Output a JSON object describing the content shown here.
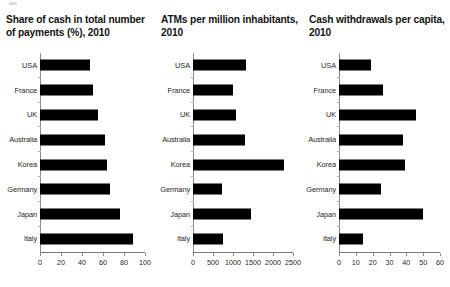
{
  "figure": {
    "background": "#ffffff",
    "bar_color": "#000000",
    "axis_color": "#8c8c8c",
    "text_color": "#1a1a1a"
  },
  "categories": [
    "USA",
    "France",
    "UK",
    "Australia",
    "Korea",
    "Germany",
    "Japan",
    "Italy"
  ],
  "panels": [
    {
      "id": "share-of-cash",
      "title": "Share of cash in total number of payments (%), 2010",
      "ticks": [
        "0",
        "20",
        "40",
        "60",
        "80",
        "100"
      ],
      "tick_values": [
        0,
        20,
        40,
        60,
        80,
        100
      ],
      "xmin": 0,
      "xmax": 100,
      "values": [
        48,
        50,
        55,
        62,
        64,
        67,
        76,
        89
      ],
      "label_width": 40
    },
    {
      "id": "atms-per-million",
      "title": "ATMs per million inhabitants, 2010",
      "ticks": [
        "0",
        "500",
        "1000",
        "1500",
        "2000",
        "2500"
      ],
      "tick_values": [
        0,
        500,
        1000,
        1500,
        2000,
        2500
      ],
      "xmin": 0,
      "xmax": 2500,
      "values": [
        1330,
        1010,
        1080,
        1300,
        2270,
        720,
        1450,
        760
      ],
      "label_width": 38
    },
    {
      "id": "cash-withdrawals-per-capita",
      "title": "Cash withdrawals per capita, 2010",
      "ticks": [
        "0",
        "10",
        "20",
        "30",
        "40",
        "50",
        "60"
      ],
      "tick_values": [
        0,
        10,
        20,
        30,
        40,
        50,
        60
      ],
      "xmin": 0,
      "xmax": 60,
      "values": [
        19,
        26,
        46,
        38,
        39,
        25,
        50,
        14
      ],
      "label_width": 36
    }
  ],
  "chart_data": [
    {
      "type": "bar",
      "orientation": "horizontal",
      "title": "Share of cash in total number of payments (%), 2010",
      "xlabel": "",
      "ylabel": "",
      "categories": [
        "USA",
        "France",
        "UK",
        "Australia",
        "Korea",
        "Germany",
        "Japan",
        "Italy"
      ],
      "values": [
        48,
        50,
        55,
        62,
        64,
        67,
        76,
        89
      ],
      "xlim": [
        0,
        100
      ],
      "xticks": [
        0,
        20,
        40,
        60,
        80,
        100
      ],
      "grid": false,
      "legend": "none"
    },
    {
      "type": "bar",
      "orientation": "horizontal",
      "title": "ATMs per million inhabitants, 2010",
      "xlabel": "",
      "ylabel": "",
      "categories": [
        "USA",
        "France",
        "UK",
        "Australia",
        "Korea",
        "Germany",
        "Japan",
        "Italy"
      ],
      "values": [
        1330,
        1010,
        1080,
        1300,
        2270,
        720,
        1450,
        760
      ],
      "xlim": [
        0,
        2500
      ],
      "xticks": [
        0,
        500,
        1000,
        1500,
        2000,
        2500
      ],
      "grid": false,
      "legend": "none"
    },
    {
      "type": "bar",
      "orientation": "horizontal",
      "title": "Cash withdrawals per capita, 2010",
      "xlabel": "",
      "ylabel": "",
      "categories": [
        "USA",
        "France",
        "UK",
        "Australia",
        "Korea",
        "Germany",
        "Japan",
        "Italy"
      ],
      "values": [
        19,
        26,
        46,
        38,
        39,
        25,
        50,
        14
      ],
      "xlim": [
        0,
        60
      ],
      "xticks": [
        0,
        10,
        20,
        30,
        40,
        50,
        60
      ],
      "grid": false,
      "legend": "none"
    }
  ]
}
